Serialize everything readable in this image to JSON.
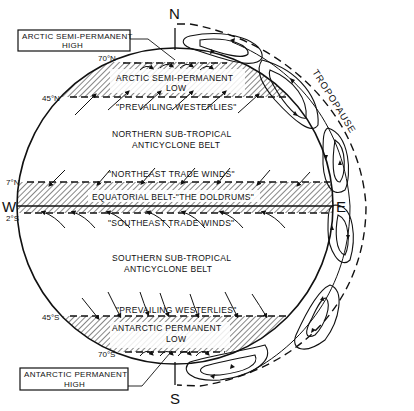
{
  "diagram": {
    "compass": {
      "north": "N",
      "south": "S",
      "west": "W",
      "east": "E"
    },
    "callouts": {
      "arctic_high": {
        "line1": "ARCTIC SEMI-PERMANENT",
        "line2": "HIGH"
      },
      "antarctic_high": {
        "line1": "ANTARCTIC PERMANENT",
        "line2": "HIGH"
      }
    },
    "latitudes": {
      "n70": "70°N",
      "n45": "45°N",
      "n7": "7°N",
      "s2": "2°S",
      "s45": "45°S",
      "s70": "70°S"
    },
    "belts": {
      "arctic_low": {
        "line1": "ARCTIC SEMI-PERMANENT",
        "line2": "LOW"
      },
      "north_westerlies": "\"PREVAILING WESTERLIES\"",
      "north_subtropical": {
        "line1": "NORTHERN SUB-TROPICAL",
        "line2": "ANTICYCLONE BELT"
      },
      "ne_trades": "\"NORTHEAST TRADE WINDS\"",
      "doldrums": "EQUATORIAL BELT-\"THE DOLDRUMS\"",
      "se_trades": "\"SOUTHEAST TRADE WINDS\"",
      "south_subtropical": {
        "line1": "SOUTHERN SUB-TROPICAL",
        "line2": "ANTICYCLONE BELT"
      },
      "south_westerlies": "\"PREVAILING WESTERLIES\"",
      "antarctic_low": {
        "line1": "ANTARCTIC PERMANENT",
        "line2": "LOW"
      }
    },
    "tropopause_label": "TROPOPAUSE",
    "colors": {
      "ink": "#111111",
      "background": "#ffffff"
    }
  }
}
